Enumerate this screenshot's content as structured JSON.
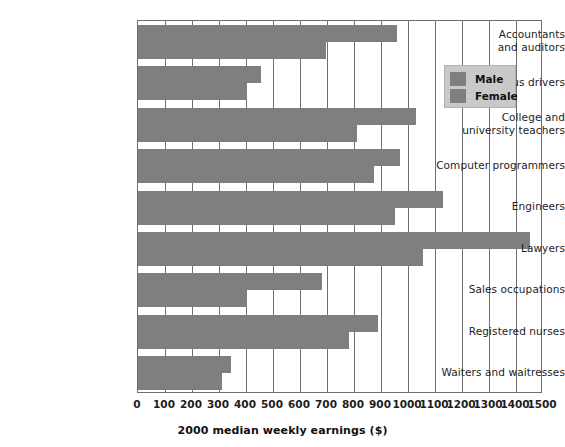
{
  "chart_data": {
    "type": "bar",
    "orientation": "horizontal",
    "title": "",
    "xlabel": "2000 median weekly earnings ($)",
    "ylabel": "",
    "xlim": [
      0,
      1500
    ],
    "xticks": [
      0,
      100,
      200,
      300,
      400,
      500,
      600,
      700,
      800,
      900,
      1000,
      1100,
      1200,
      1300,
      1400,
      1500
    ],
    "xtick_labels": [
      "0",
      "100",
      "200",
      "300",
      "400",
      "500",
      "600",
      "700",
      "800",
      "900",
      "1000",
      "1100",
      "1200",
      "1300",
      "1400",
      "1500"
    ],
    "grid": true,
    "grid_axis": "x",
    "legend": [
      "Male",
      "Female"
    ],
    "legend_position": "upper right",
    "bar_color": "#7f7f7f",
    "categories": [
      "Accountants and auditors",
      "Bus drivers",
      "College and university teachers",
      "Computer programmers",
      "Engineers",
      "Lawyers",
      "Sales occupations",
      "Registered nurses",
      "Waiters and waitresses"
    ],
    "category_lines": [
      [
        "Accountants",
        "and auditors"
      ],
      [
        "Bus drivers"
      ],
      [
        "College and",
        "university teachers"
      ],
      [
        "Computer programmers"
      ],
      [
        "Engineers"
      ],
      [
        "Lawyers"
      ],
      [
        "Sales occupations"
      ],
      [
        "Registered nurses"
      ],
      [
        "Waiters and waitresses"
      ]
    ],
    "series": [
      {
        "name": "Male",
        "values": [
          960,
          455,
          1030,
          970,
          1130,
          1450,
          680,
          890,
          345
        ]
      },
      {
        "name": "Female",
        "values": [
          695,
          405,
          810,
          875,
          950,
          1055,
          405,
          780,
          310
        ]
      }
    ]
  },
  "axis": {
    "x_title": "2000 median weekly earnings ($)"
  },
  "legend": {
    "items": [
      {
        "label": "Male",
        "color": "#7f7f7f"
      },
      {
        "label": "Female",
        "color": "#7f7f7f"
      }
    ]
  }
}
